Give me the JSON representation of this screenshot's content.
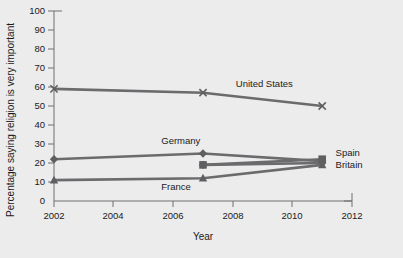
{
  "chart_data": {
    "type": "line",
    "title": "",
    "xlabel": "Year",
    "ylabel": "Percentage saying religion is very important",
    "xlim": [
      2002,
      2012
    ],
    "ylim": [
      0,
      100
    ],
    "xticks": [
      2002,
      2004,
      2006,
      2008,
      2010,
      2012
    ],
    "yticks": [
      0,
      10,
      20,
      30,
      40,
      50,
      60,
      70,
      80,
      90,
      100
    ],
    "grid": false,
    "legend_position": "inline-annotations",
    "series": [
      {
        "name": "United States",
        "marker": "x",
        "x": [
          2002,
          2007,
          2011
        ],
        "values": [
          59,
          57,
          50
        ]
      },
      {
        "name": "Germany",
        "marker": "diamond",
        "x": [
          2002,
          2007,
          2011
        ],
        "values": [
          22,
          25,
          21
        ]
      },
      {
        "name": "Spain",
        "marker": "square",
        "x": [
          2007,
          2011
        ],
        "values": [
          19,
          22
        ]
      },
      {
        "name": "Britain",
        "marker": "diamond",
        "x": [
          2007,
          2011
        ],
        "values": [
          19,
          20
        ]
      },
      {
        "name": "France",
        "marker": "triangle",
        "x": [
          2002,
          2007,
          2011
        ],
        "values": [
          11,
          12,
          19
        ]
      }
    ],
    "annotations": [
      {
        "text": "United States",
        "x": 2008.1,
        "y": 60
      },
      {
        "text": "Germany",
        "x": 2005.6,
        "y": 30
      },
      {
        "text": "France",
        "x": 2005.6,
        "y": 6
      },
      {
        "text": "Spain",
        "x": 2011.45,
        "y": 23.5
      },
      {
        "text": "Britain",
        "x": 2011.45,
        "y": 17.5
      }
    ]
  },
  "axis": {
    "y_title": "Percentage saying religion is very important",
    "x_title": "Year",
    "y_tick_labels": [
      "100",
      "90",
      "80",
      "70",
      "60",
      "50",
      "40",
      "30",
      "20",
      "10",
      "0"
    ],
    "x_tick_labels": [
      "2002",
      "2004",
      "2006",
      "2008",
      "2010",
      "2012"
    ]
  },
  "colors": {
    "background": "#ececed",
    "line": "#6b6b6d",
    "axis": "#6e6e70",
    "text": "#1a1a1a"
  }
}
